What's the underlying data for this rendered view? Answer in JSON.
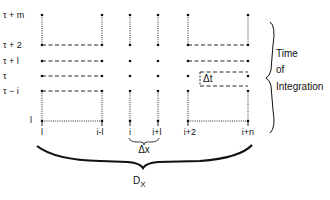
{
  "diagram": {
    "rows": [
      {
        "label": "τ + m",
        "y": 15
      },
      {
        "label": "τ + 2",
        "y": 45
      },
      {
        "label": "τ + l",
        "y": 61
      },
      {
        "label": "τ",
        "y": 76
      },
      {
        "label": "τ − i",
        "y": 91
      },
      {
        "label": "l",
        "y": 121
      }
    ],
    "columns": [
      {
        "label": "l",
        "x": 42
      },
      {
        "label": "i-l",
        "x": 102
      },
      {
        "label": "i",
        "x": 130
      },
      {
        "label": "i+l",
        "x": 158
      },
      {
        "label": "i+2",
        "x": 188
      },
      {
        "label": "i+n",
        "x": 248
      }
    ],
    "delta_t_label": "Δt",
    "delta_x_label": "Δx",
    "domain_label": "D",
    "domain_subscript": "X",
    "side_label": {
      "line1": "Time",
      "line2": "of",
      "line3": "Integration"
    },
    "colors": {
      "ink": "#111111",
      "background": "#ffffff"
    }
  }
}
